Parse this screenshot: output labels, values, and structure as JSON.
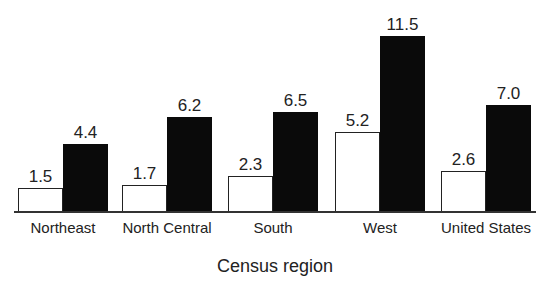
{
  "chart_data": {
    "type": "bar",
    "title": "",
    "xlabel": "Census region",
    "ylabel": "",
    "categories": [
      "Northeast",
      "North Central",
      "South",
      "West",
      "United States"
    ],
    "series": [
      {
        "name": "Series 1 (white)",
        "color": "#ffffff",
        "values": [
          1.5,
          1.7,
          2.3,
          5.2,
          2.6
        ]
      },
      {
        "name": "Series 2 (black)",
        "color": "#000000",
        "values": [
          4.4,
          6.2,
          6.5,
          11.5,
          7.0
        ]
      }
    ],
    "value_labels": {
      "white": [
        "1.5",
        "1.7",
        "2.3",
        "5.2",
        "2.6"
      ],
      "black": [
        "4.4",
        "6.2",
        "6.5",
        "11.5",
        "7.0"
      ]
    },
    "ylim": [
      0,
      12
    ],
    "grid": false,
    "legend": "none",
    "data_labels": true
  }
}
